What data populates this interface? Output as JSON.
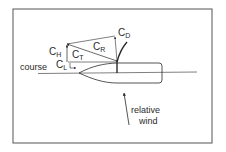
{
  "diagram": {
    "labels": {
      "course": "course",
      "relative_wind_line1": "relative",
      "relative_wind_line2": "wind",
      "c_d": "C",
      "c_d_sub": "D",
      "c_h": "C",
      "c_h_sub": "H",
      "c_t": "C",
      "c_t_sub": "T",
      "c_r": "C",
      "c_r_sub": "R",
      "c_l": "C",
      "c_l_sub": "L"
    },
    "colors": {
      "line": "#2a2a2a",
      "frame": "#555555",
      "background": "#ffffff"
    }
  }
}
